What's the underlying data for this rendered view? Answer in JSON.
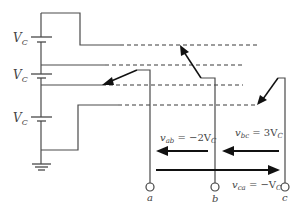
{
  "diagram": {
    "source_labels": [
      "V_C",
      "V_C",
      "V_C"
    ],
    "terminals": [
      {
        "id": "a",
        "label": "a"
      },
      {
        "id": "b",
        "label": "b"
      },
      {
        "id": "c",
        "label": "c"
      }
    ],
    "voltages": {
      "vab": {
        "sym": "v",
        "sub": "ab",
        "eq": " = −2V",
        "subC": "C"
      },
      "vbc": {
        "sym": "v",
        "sub": "bc",
        "eq": " = 3V",
        "subC": "C"
      },
      "vca": {
        "sym": "v",
        "sub": "ca",
        "eq": " = −V",
        "subC": "C"
      }
    },
    "colors": {
      "wire": "#4a4a4a",
      "arrow": "#111111",
      "background": "#ffffff"
    }
  }
}
